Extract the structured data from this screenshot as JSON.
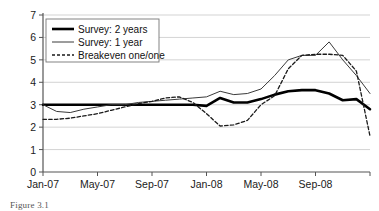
{
  "figure": {
    "caption": "Figure 3.1"
  },
  "chart_data": {
    "type": "line",
    "title": "",
    "xlabel": "",
    "ylabel": "",
    "ylim": [
      0,
      7
    ],
    "yticks": [
      0,
      1,
      2,
      3,
      4,
      5,
      6,
      7
    ],
    "grid": true,
    "legend_position": "top-left",
    "x_tick_labels": [
      "Jan-07",
      "May-07",
      "Sep-07",
      "Jan-08",
      "May-08",
      "Sep-08"
    ],
    "x_tick_indices": [
      0,
      4,
      8,
      12,
      16,
      20
    ],
    "x": [
      "Jan-07",
      "Feb-07",
      "Mar-07",
      "Apr-07",
      "May-07",
      "Jun-07",
      "Jul-07",
      "Aug-07",
      "Sep-07",
      "Oct-07",
      "Nov-07",
      "Dec-07",
      "Jan-08",
      "Feb-08",
      "Mar-08",
      "Apr-08",
      "May-08",
      "Jun-08",
      "Jul-08",
      "Aug-08",
      "Sep-08",
      "Oct-08",
      "Nov-08",
      "Dec-08",
      "Jan-09"
    ],
    "series": [
      {
        "name": "Survey: 2 years",
        "style": "thick-solid",
        "color": "#000000",
        "values": [
          3.0,
          3.0,
          3.0,
          3.0,
          3.0,
          3.0,
          3.0,
          3.0,
          3.0,
          3.0,
          3.0,
          3.0,
          2.95,
          3.3,
          3.1,
          3.1,
          3.25,
          3.45,
          3.6,
          3.65,
          3.65,
          3.5,
          3.2,
          3.25,
          2.8
        ]
      },
      {
        "name": "Survey: 1 year",
        "style": "thin-solid",
        "color": "#3a3a3a",
        "values": [
          3.0,
          2.7,
          2.65,
          2.8,
          2.9,
          3.0,
          3.0,
          3.1,
          3.15,
          3.2,
          3.25,
          3.3,
          3.35,
          3.6,
          3.45,
          3.5,
          3.7,
          4.3,
          5.0,
          5.2,
          5.2,
          5.8,
          5.0,
          4.3,
          3.5
        ]
      },
      {
        "name": "Breakeven one/one",
        "style": "dashed",
        "color": "#1a1a1a",
        "values": [
          2.35,
          2.35,
          2.4,
          2.5,
          2.6,
          2.75,
          2.9,
          3.05,
          3.15,
          3.3,
          3.35,
          3.1,
          2.6,
          2.05,
          2.1,
          2.3,
          3.0,
          3.4,
          4.6,
          5.2,
          5.25,
          5.25,
          5.2,
          4.5,
          1.6
        ]
      }
    ]
  }
}
